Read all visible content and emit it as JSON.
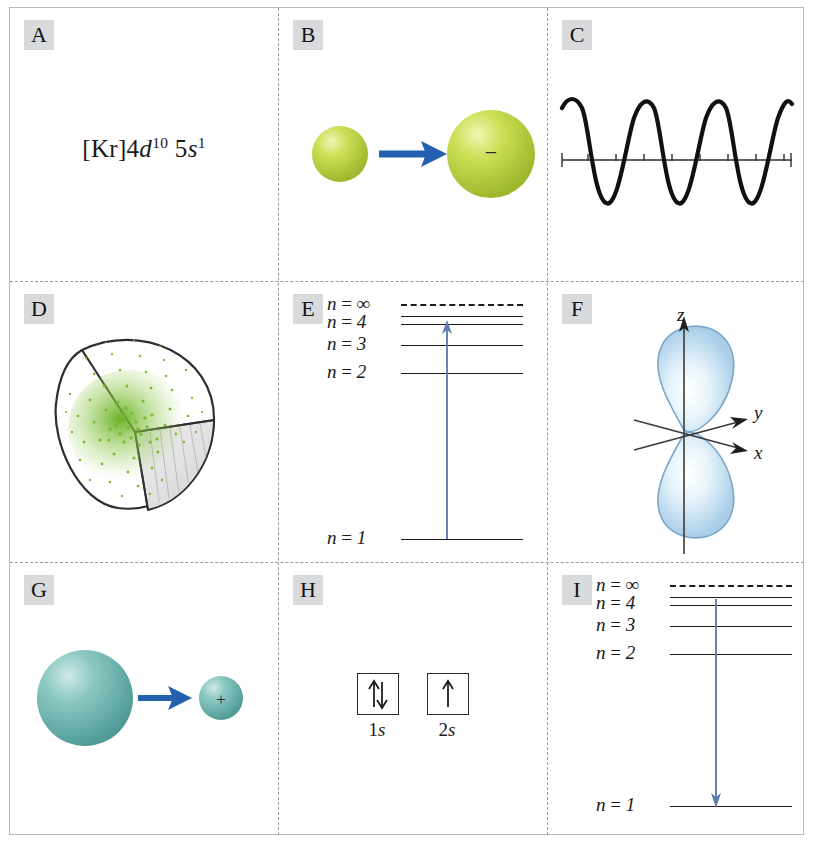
{
  "figure": {
    "layout": "3x3 grid of lettered panels",
    "columns": 3,
    "rows": 3,
    "border_color": "#b9b9b9",
    "divider_style": "dashed",
    "divider_color": "#9a9a9a",
    "badge_bg": "#d8dadc"
  },
  "colors": {
    "arrow_blue": "#2360b0",
    "level_arrow_blue": "#5c7fae",
    "sphere_yellow_green": "#b5ce3a",
    "sphere_yellow_green_light": "#e2ee94",
    "sphere_teal": "#6cb5b0",
    "sphere_teal_light": "#bfe3df",
    "orbital_blue": "#bcd9ee",
    "orbital_blue_light": "#f2fafd",
    "orbital_outline": "#7aa7cc",
    "density_green": "#7cba34",
    "ink": "#1c1c1c"
  },
  "panels": [
    {
      "id": "A",
      "label": "A",
      "kind": "electron-configuration",
      "formula": {
        "core": "[Kr]",
        "terms": [
          {
            "n": "4",
            "orbital": "d",
            "electrons": "10"
          },
          {
            "n": "5",
            "orbital": "s",
            "electrons": "1"
          }
        ],
        "plain": "[Kr]4d10 5s1"
      }
    },
    {
      "id": "B",
      "label": "B",
      "kind": "anion-formation",
      "before": {
        "charge": "",
        "relative_size": "small",
        "color": "#b5ce3a"
      },
      "after": {
        "charge": "−",
        "relative_size": "large",
        "color": "#b5ce3a"
      },
      "arrow": {
        "direction": "right",
        "color": "#2360b0"
      }
    },
    {
      "id": "C",
      "label": "C",
      "kind": "wave",
      "cycles": 4.5,
      "tick_count": 9,
      "axis": "horizontal",
      "amplitude_label": "",
      "wave_color": "#111111"
    },
    {
      "id": "D",
      "label": "D",
      "kind": "electron-density-cutaway",
      "shape": "sphere with wedge cut away",
      "dot_color": "#7cba34",
      "dot_count": 210,
      "densest_at": "center"
    },
    {
      "id": "E",
      "label": "E",
      "kind": "energy-level-diagram",
      "transition": {
        "from": "n = 1",
        "to": "n = 4",
        "direction": "up",
        "process": "absorption"
      },
      "levels": [
        {
          "label": "n = ∞",
          "n": "∞",
          "dashed": true,
          "show_label": true
        },
        {
          "label": "",
          "n": "5",
          "dashed": false,
          "show_label": false
        },
        {
          "label": "n = 4",
          "n": "4",
          "dashed": false,
          "show_label": true
        },
        {
          "label": "n = 3",
          "n": "3",
          "dashed": false,
          "show_label": true
        },
        {
          "label": "n = 2",
          "n": "2",
          "dashed": false,
          "show_label": true
        },
        {
          "label": "n = 1",
          "n": "1",
          "dashed": false,
          "show_label": true
        }
      ]
    },
    {
      "id": "F",
      "label": "F",
      "kind": "p-orbital",
      "orbital": "p_z",
      "axes": [
        {
          "name": "z",
          "direction": "up"
        },
        {
          "name": "y",
          "direction": "upper-right"
        },
        {
          "name": "x",
          "direction": "lower-right"
        }
      ],
      "lobes": 2,
      "lobe_color": "#bcd9ee"
    },
    {
      "id": "G",
      "label": "G",
      "kind": "cation-formation",
      "before": {
        "charge": "",
        "relative_size": "large",
        "color": "#6cb5b0"
      },
      "after": {
        "charge": "+",
        "relative_size": "small",
        "color": "#6cb5b0"
      },
      "arrow": {
        "direction": "right",
        "color": "#2360b0"
      }
    },
    {
      "id": "H",
      "label": "H",
      "kind": "orbital-diagram",
      "boxes": [
        {
          "label_n": "1",
          "label_orbital": "s",
          "label": "1s",
          "spins": [
            "up",
            "down"
          ],
          "electrons": 2
        },
        {
          "label_n": "2",
          "label_orbital": "s",
          "label": "2s",
          "spins": [
            "up"
          ],
          "electrons": 1
        }
      ]
    },
    {
      "id": "I",
      "label": "I",
      "kind": "energy-level-diagram",
      "transition": {
        "from": "n = 4",
        "to": "n = 1",
        "direction": "down",
        "process": "emission"
      },
      "levels": [
        {
          "label": "n = ∞",
          "n": "∞",
          "dashed": true,
          "show_label": true
        },
        {
          "label": "",
          "n": "5",
          "dashed": false,
          "show_label": false
        },
        {
          "label": "n = 4",
          "n": "4",
          "dashed": false,
          "show_label": true
        },
        {
          "label": "n = 3",
          "n": "3",
          "dashed": false,
          "show_label": true
        },
        {
          "label": "n = 2",
          "n": "2",
          "dashed": false,
          "show_label": true
        },
        {
          "label": "n = 1",
          "n": "1",
          "dashed": false,
          "show_label": true
        }
      ]
    }
  ]
}
